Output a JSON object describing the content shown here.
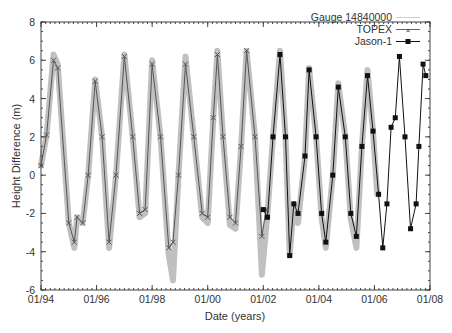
{
  "chart_data": {
    "type": "line",
    "title": "",
    "xlabel": "Date (years)",
    "ylabel": "Height Difference (m)",
    "xlim": [
      1994,
      2008
    ],
    "ylim": [
      -6,
      8
    ],
    "x_ticks": [
      "01/94",
      "01/96",
      "01/98",
      "01/00",
      "01/02",
      "01/04",
      "01/06",
      "01/08"
    ],
    "y_ticks": [
      "-6",
      "-4",
      "-2",
      "0",
      "2",
      "4",
      "6",
      "8"
    ],
    "grid": false,
    "legend_position": "top-right",
    "series": [
      {
        "name": "Gauge 14840000",
        "style": "thick light gray line",
        "color": "#c0c0c0",
        "x": [
          1994.0,
          1994.2,
          1994.45,
          1994.6,
          1995.0,
          1995.2,
          1995.3,
          1995.5,
          1995.7,
          1995.95,
          1996.2,
          1996.45,
          1996.7,
          1997.0,
          1997.3,
          1997.55,
          1997.75,
          1998.0,
          1998.3,
          1998.6,
          1998.75,
          1998.95,
          1999.2,
          1999.5,
          1999.8,
          2000.0,
          2000.2,
          2000.35,
          2000.55,
          2000.8,
          2001.0,
          2001.2,
          2001.4,
          2001.7,
          2001.95,
          2002.15,
          2002.35,
          2002.6,
          2002.8,
          2002.95,
          2003.1,
          2003.25,
          2003.5,
          2003.65,
          2003.9,
          2004.1,
          2004.25,
          2004.5,
          2004.7,
          2004.95,
          2005.15,
          2005.35,
          2005.55,
          2005.75,
          2005.95,
          2006.1
        ],
        "y": [
          0.5,
          2.1,
          6.3,
          5.8,
          -2.5,
          -3.8,
          -2.2,
          -2.5,
          0,
          5.0,
          2,
          -3.8,
          0,
          6.3,
          2,
          -2.2,
          -2.0,
          6.0,
          2,
          -4.2,
          -5.5,
          0,
          6.2,
          2,
          -2.2,
          -2.5,
          3,
          6.5,
          2,
          -2.6,
          -2.8,
          1.5,
          6.5,
          2,
          -5.2,
          -2.0,
          2,
          6.5,
          2,
          -4.2,
          -1.5,
          -2.5,
          1,
          5.6,
          2,
          -2.2,
          -3.8,
          0,
          4.8,
          2,
          -2.3,
          -3.8,
          1.5,
          5.5,
          2.3,
          -1.0
        ]
      },
      {
        "name": "TOPEX",
        "style": "line with x markers",
        "color": "#555555",
        "x": [
          1994.0,
          1994.2,
          1994.45,
          1994.6,
          1995.0,
          1995.2,
          1995.3,
          1995.5,
          1995.7,
          1995.95,
          1996.2,
          1996.45,
          1996.7,
          1997.0,
          1997.3,
          1997.55,
          1997.75,
          1998.0,
          1998.3,
          1998.6,
          1998.75,
          1998.95,
          1999.2,
          1999.5,
          1999.8,
          2000.0,
          2000.2,
          2000.35,
          2000.55,
          2000.8,
          2001.0,
          2001.2,
          2001.4,
          2001.7,
          2001.95,
          2002.1
        ],
        "y": [
          0.5,
          2.1,
          6.0,
          5.6,
          -2.5,
          -3.5,
          -2.2,
          -2.5,
          0,
          4.9,
          2,
          -3.5,
          0,
          6.2,
          2,
          -2.0,
          -1.8,
          5.8,
          2,
          -3.8,
          -3.5,
          0,
          5.8,
          2,
          -2.0,
          -2.2,
          3,
          6.3,
          2,
          -2.2,
          -2.5,
          1.5,
          6.5,
          2,
          -3.2,
          -1.8
        ]
      },
      {
        "name": "Jason-1",
        "style": "line with filled square markers",
        "color": "#111111",
        "x": [
          2002.0,
          2002.15,
          2002.35,
          2002.6,
          2002.8,
          2002.95,
          2003.1,
          2003.25,
          2003.5,
          2003.65,
          2003.9,
          2004.1,
          2004.25,
          2004.5,
          2004.7,
          2004.95,
          2005.15,
          2005.35,
          2005.55,
          2005.75,
          2005.95,
          2006.15,
          2006.3,
          2006.45,
          2006.6,
          2006.75,
          2006.9,
          2007.1,
          2007.3,
          2007.5,
          2007.6,
          2007.75,
          2007.85
        ],
        "y": [
          -1.8,
          -2.2,
          2,
          6.3,
          2,
          -4.2,
          -1.5,
          -2.0,
          1,
          5.5,
          2,
          -2.0,
          -3.5,
          0,
          4.6,
          2,
          -2.0,
          -3.2,
          1.5,
          5.2,
          2.3,
          -1.0,
          -3.8,
          -1.5,
          2.5,
          3.0,
          6.2,
          2,
          -2.8,
          -1.5,
          1.5,
          5.8,
          5.2
        ]
      }
    ]
  },
  "legend": {
    "items": [
      "Gauge 14840000",
      "TOPEX",
      "Jason-1"
    ]
  }
}
